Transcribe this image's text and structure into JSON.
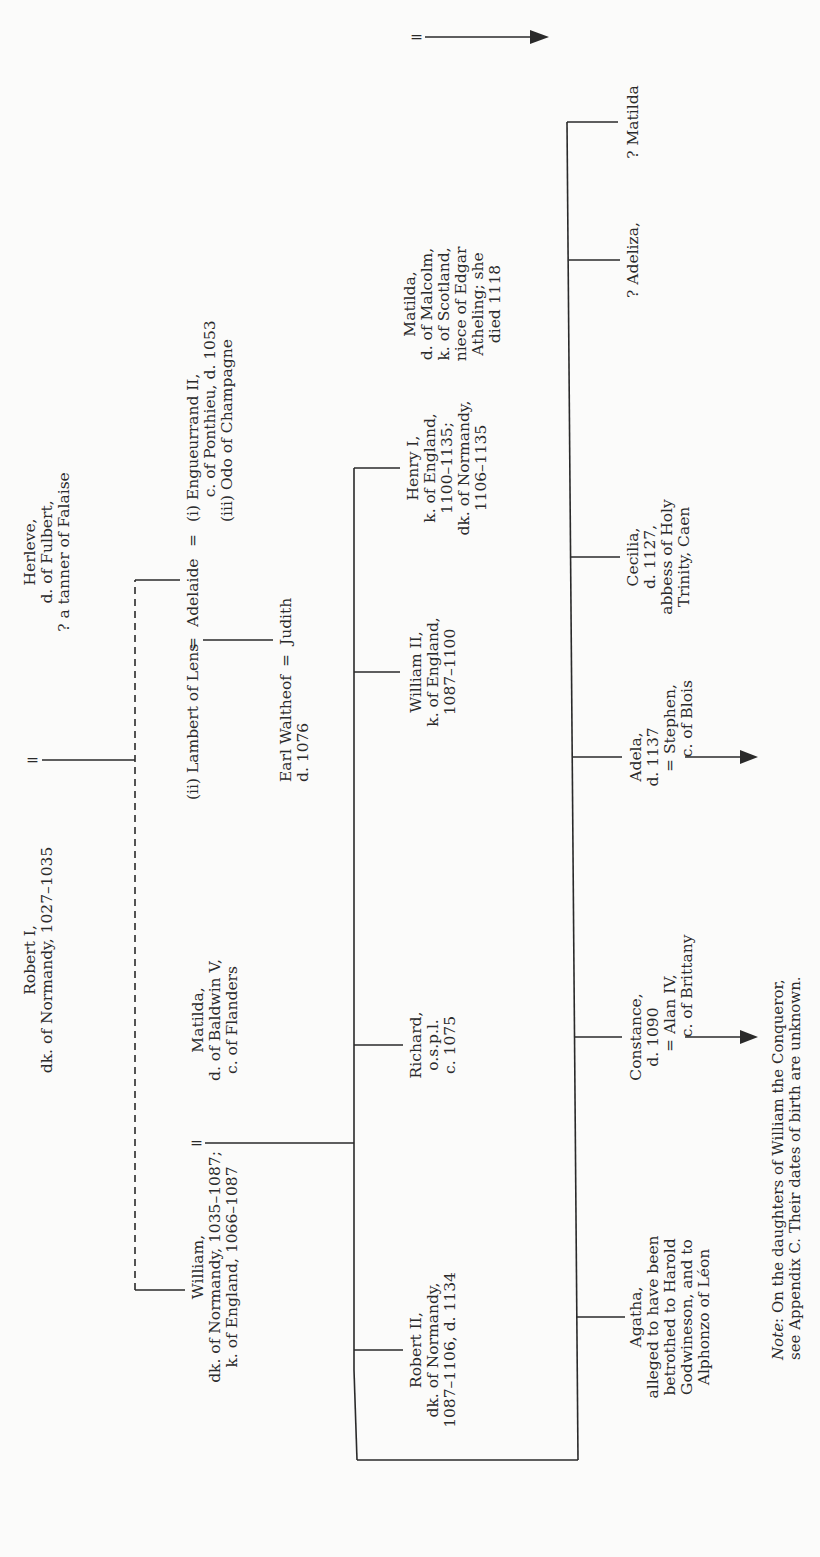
{
  "diagram": {
    "type": "genealogical-tree",
    "orientation": "rotated-90-ccw",
    "line_color": "#2a2a2a",
    "background": "#fbfbfa",
    "persons": {
      "robert_i": "Robert I,\ndk. of Normandy, 1027–1035",
      "herleve": "Herleve,\nd. of Fulbert,\n? a tanner of Falaise",
      "william": "William,\ndk. of Normandy, 1035–1087;\nk. of England, 1066–1087",
      "matilda_flanders": "Matilda,\nd. of Baldwin V,\nc. of Flanders",
      "lambert": "(ii) Lambert of Lens",
      "adelaide": "Adelaide",
      "adelaide_husbands": "(i) Engueurrand II,\n     c. of Ponthieu, d. 1053\n(iii) Odo of Champagne",
      "waltheof": "Earl Waltheof\nd. 1076",
      "judith": "Judith",
      "robert_ii": "Robert II,\ndk. of Normandy,\n1087–1106, d. 1134",
      "richard": "Richard,\no.s.p.l.\nc. 1075",
      "william_ii": "William II,\nk. of England,\n1087–1100",
      "henry_i": "Henry I,\nk. of England,\n1100–1135;\ndk. of Normandy,\n1106–1135",
      "matilda_scotland": "Matilda,\nd. of Malcolm,\nk. of Scotland,\nniece of Edgar\nAtheling; she\ndied 1118",
      "agatha": "Agatha,\nalleged to have been\nbetrothed to Harold\nGodwineson, and to\nAlphonzo of Léon",
      "constance": "Constance,\nd. 1090",
      "alan_iv": "= Alan IV,\n   c. of Brittany",
      "adela": "Adela,\nd. 1137",
      "stephen": "= Stephen,\n   c. of Blois",
      "cecilia": "Cecilia,\nd. 1127,\nabbess of Holy\nTrinity, Caen",
      "adeliza": "? Adeliza,",
      "matilda_dau": "? Matilda"
    },
    "symbols": {
      "marriage": "=",
      "eq_lambert_adelaide": "=",
      "eq_adelaide_husbands": "=",
      "eq_waltheof_judith": "="
    },
    "note": {
      "label": "Note",
      "text": ": On the daughters of William the Conqueror,\nsee Appendix C. Their dates of birth are unknown."
    }
  }
}
